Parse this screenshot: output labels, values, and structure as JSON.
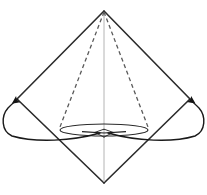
{
  "figure": {
    "type": "geometric-line-diagram",
    "canvas": {
      "width": 207,
      "height": 195,
      "background": "#ffffff"
    },
    "colors": {
      "outline": "#2b2b2b",
      "dashed": "#5a5a5a",
      "axis": "#b4b4b4",
      "base_ellipse": "#2b2b2b",
      "arrow": "#1a1a1a",
      "fill": "none"
    },
    "points": {
      "apex": {
        "x": 104,
        "y": 11,
        "label": "apex"
      },
      "left_vertex": {
        "x": 17,
        "y": 99,
        "label": "left-vertex"
      },
      "right_vertex": {
        "x": 190,
        "y": 99,
        "label": "right-vertex"
      },
      "bottom_vertex": {
        "x": 104,
        "y": 183,
        "label": "bottom-vertex"
      },
      "center": {
        "x": 104,
        "y": 133,
        "label": "base-center"
      },
      "left_base_edge": {
        "x": 60,
        "y": 127,
        "label": "left-base-edge"
      },
      "right_base_edge": {
        "x": 148,
        "y": 127,
        "label": "right-base-edge"
      }
    },
    "base_ellipse": {
      "cx": 104,
      "cy": 130,
      "rx": 44,
      "ry": 6
    },
    "strokes": {
      "outline_width": 1.6,
      "dashed_width": 1.3,
      "dash_pattern": "4 3",
      "axis_width": 1,
      "ellipse_width": 1.2,
      "arrow_width": 1.4
    },
    "elements": [
      {
        "name": "outline-upper-left-edge",
        "desc": "apex to left vertex"
      },
      {
        "name": "outline-upper-right-edge",
        "desc": "apex to right vertex"
      },
      {
        "name": "outline-lower-left-edge",
        "desc": "left vertex to bottom vertex"
      },
      {
        "name": "outline-lower-right-edge",
        "desc": "right vertex to bottom vertex"
      },
      {
        "name": "dashed-left-slant",
        "desc": "apex to left base edge"
      },
      {
        "name": "dashed-right-slant",
        "desc": "apex to right base edge"
      },
      {
        "name": "vertical-axis",
        "desc": "apex down through base center"
      },
      {
        "name": "base-ellipse",
        "desc": "flat ellipse forming cone base"
      },
      {
        "name": "left-sweep-arrow",
        "desc": "curve from center sweeping out and up to left vertex"
      },
      {
        "name": "right-sweep-arrow",
        "desc": "curve from center sweeping out and up to right vertex"
      },
      {
        "name": "center-inward-arrowheads",
        "desc": "two thin arrowheads meeting at base center"
      }
    ]
  }
}
